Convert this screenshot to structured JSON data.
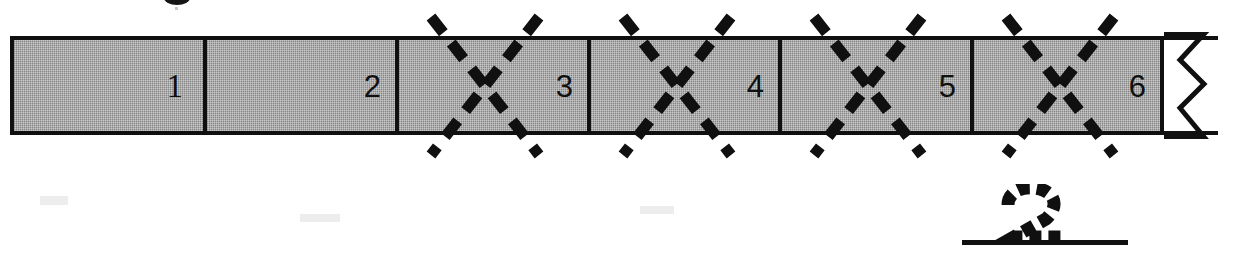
{
  "figure": {
    "name": "partitioned-measurement-bar",
    "bar": {
      "fill_color": "#9c9c9c",
      "outline_color": "#101010",
      "segment_count": 6,
      "segments": [
        {
          "label": "1",
          "shaded": true,
          "crossed_out": false
        },
        {
          "label": "2",
          "shaded": true,
          "crossed_out": false
        },
        {
          "label": "3",
          "shaded": true,
          "crossed_out": true
        },
        {
          "label": "4",
          "shaded": true,
          "crossed_out": true
        },
        {
          "label": "5",
          "shaded": true,
          "crossed_out": true
        },
        {
          "label": "6",
          "shaded": true,
          "crossed_out": true
        }
      ],
      "trailing_segment": {
        "label": "",
        "shaded": false,
        "break_mark": "zigzag"
      },
      "cross_out_marks": {
        "count": 4,
        "style": "dashed-diagonal-x",
        "color": "#101010",
        "centers_x": [
          485,
          677,
          868,
          1060
        ]
      }
    }
  },
  "answer": {
    "name": "handwritten-answer",
    "value": "2",
    "style": "dashed-handwriting",
    "unit": "inches",
    "blank_line_color": "#101010"
  }
}
